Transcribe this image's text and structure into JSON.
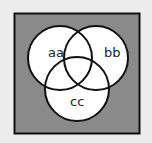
{
  "diagram": {
    "type": "venn",
    "background_color": "#ececec",
    "universe": {
      "fill": "#8a8a8a",
      "stroke": "#111111"
    },
    "sets": [
      {
        "id": "a",
        "label": "aa",
        "cx": 60,
        "cy": 58,
        "r": 32
      },
      {
        "id": "b",
        "label": "bb",
        "cx": 96,
        "cy": 58,
        "r": 32
      },
      {
        "id": "c",
        "label": "cc",
        "cx": 77,
        "cy": 89,
        "r": 32
      }
    ],
    "circle_fill": "#ffffff",
    "circle_stroke": "#111111"
  }
}
